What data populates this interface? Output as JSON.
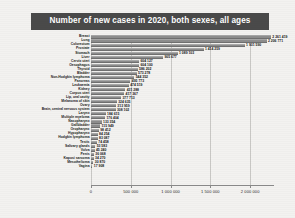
{
  "title": "Number of new cases in 2020, both sexes, all ages",
  "colors": {
    "title_banner_bg": "#4a4a4a",
    "title_text": "#ffffff",
    "bar_fill": "#8d8d8d",
    "page_bg": "#f3f2f0",
    "gridline": "#c9c8c5",
    "axis": "#8a8a8a"
  },
  "chart_data": {
    "type": "bar",
    "orientation": "horizontal",
    "title": "Number of new cases in 2020, both sexes, all ages",
    "xlabel": "",
    "ylabel": "",
    "xlim": [
      0,
      2300000
    ],
    "grid": true,
    "legend": "none",
    "xticks": [
      0,
      500000,
      1000000,
      1500000,
      2000000
    ],
    "xtick_labels": [
      "0",
      "500 000",
      "1 000 000",
      "1 500 000",
      "2 000 000"
    ],
    "categories": [
      "Breast",
      "Lung",
      "Colorectum",
      "Prostate",
      "Stomach",
      "Liver",
      "Cervix uteri",
      "Oesophagus",
      "Thyroid",
      "Bladder",
      "Non-Hodgkin lymphoma",
      "Pancreas",
      "Leukaemia",
      "Kidney",
      "Corpus uteri",
      "Lip, oral cavity",
      "Melanoma of skin",
      "Ovary",
      "Brain, central nervous system",
      "Larynx",
      "Multiple myeloma",
      "Nasopharynx",
      "Gallbladder",
      "Oropharynx",
      "Hypopharynx",
      "Hodgkin lymphoma",
      "Testis",
      "Salivary glands",
      "Vulva",
      "Penis",
      "Kaposi sarcoma",
      "Mesothelioma",
      "Vagina"
    ],
    "values": [
      2261419,
      2206771,
      1931590,
      1414259,
      1089103,
      905677,
      604127,
      604100,
      586202,
      573278,
      544352,
      495773,
      474519,
      431288,
      417367,
      377713,
      324635,
      313959,
      308102,
      184615,
      176404,
      133354,
      115949,
      98412,
      84254,
      83087,
      74458,
      53583,
      45240,
      36068,
      34270,
      30870,
      17908
    ],
    "value_labels": [
      "2 261 419",
      "2 206 771",
      "1 931 590",
      "1 414 259",
      "1 089 103",
      "905 677",
      "604 127",
      "604 100",
      "586 202",
      "573 278",
      "544 352",
      "495 773",
      "474 519",
      "431 288",
      "417 367",
      "377 713",
      "324 635",
      "313 959",
      "308 102",
      "184 615",
      "176 404",
      "133 354",
      "115 949",
      "98 412",
      "84 254",
      "83 087",
      "74 458",
      "53 583",
      "45 240",
      "36 068",
      "34 270",
      "30 870",
      "17 908"
    ]
  }
}
